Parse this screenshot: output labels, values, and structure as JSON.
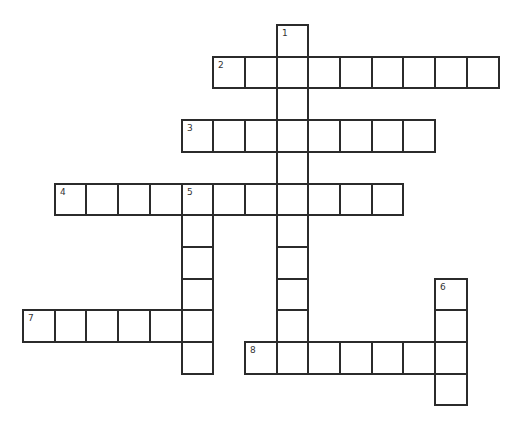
{
  "puzzle": {
    "type": "crossword",
    "grid_origin": {
      "x": 23,
      "y": 25
    },
    "cell_size": 31.7,
    "colors": {
      "border": "#2b2b2b",
      "cell_bg": "#ffffff",
      "number": "#333333"
    },
    "words": [
      {
        "number": "1",
        "direction": "down",
        "row": 0,
        "col": 8,
        "length": 11
      },
      {
        "number": "2",
        "direction": "across",
        "row": 1,
        "col": 6,
        "length": 9
      },
      {
        "number": "3",
        "direction": "across",
        "row": 3,
        "col": 5,
        "length": 8
      },
      {
        "number": "4",
        "direction": "across",
        "row": 5,
        "col": 1,
        "length": 11
      },
      {
        "number": "5",
        "direction": "down",
        "row": 5,
        "col": 5,
        "length": 6
      },
      {
        "number": "6",
        "direction": "down",
        "row": 8,
        "col": 13,
        "length": 4
      },
      {
        "number": "7",
        "direction": "across",
        "row": 9,
        "col": 0,
        "length": 6
      },
      {
        "number": "8",
        "direction": "across",
        "row": 10,
        "col": 7,
        "length": 7
      }
    ]
  }
}
